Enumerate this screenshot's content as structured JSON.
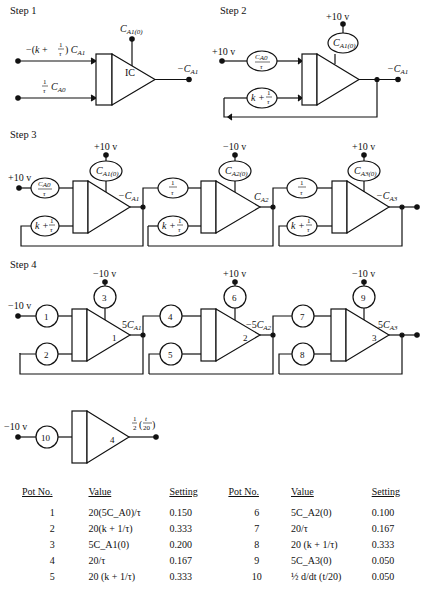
{
  "steps": [
    {
      "label": "Step 1",
      "opamp_label": "IC",
      "inputs": [
        "−(k + 1/τ) C_A1",
        "1/τ C_A0"
      ],
      "ic_input": "C_A1(0)",
      "output": "−C_A1"
    },
    {
      "label": "Step 2",
      "supply_top": "+10 v",
      "supply_in": "+10 v",
      "pots": [
        "C_A0/τ",
        "k + 1/τ",
        "C_A1(0)"
      ],
      "output": "−C_A1"
    },
    {
      "label": "Step 3",
      "stages": [
        {
          "supply_in": "+10 v",
          "supply_top": "+10 v",
          "pots": [
            "C_A0/τ",
            "k + 1/τ",
            "C_A1(0)"
          ],
          "output": "−C_A1"
        },
        {
          "supply_top": "−10 v",
          "pots": [
            "1/τ",
            "k + 1/τ",
            "C_A2(0)"
          ],
          "output": "C_A2"
        },
        {
          "supply_top": "+10 v",
          "pots": [
            "1/τ",
            "k + 1/τ",
            "C_A3(0)"
          ],
          "output": "−C_A3"
        }
      ]
    },
    {
      "label": "Step 4",
      "stages": [
        {
          "supply_in": "−10 v",
          "supply_top": "−10 v",
          "pots": [
            "1",
            "2",
            "3"
          ],
          "amp": "1",
          "output": "5C_A1"
        },
        {
          "supply_top": "+10 v",
          "pots": [
            "4",
            "5",
            "6"
          ],
          "amp": "2",
          "output": "−5C_A2"
        },
        {
          "supply_top": "−10 v",
          "pots": [
            "7",
            "8",
            "9"
          ],
          "amp": "3",
          "output": "5C_A3"
        },
        {
          "supply_in": "−10 v",
          "pots": [
            "10"
          ],
          "amp": "4",
          "output": "½ (t/20)"
        }
      ]
    }
  ],
  "table": {
    "headers": [
      "Pot No.",
      "Value",
      "Setting",
      "Pot No.",
      "Value",
      "Setting"
    ],
    "rows": [
      {
        "no1": "1",
        "val1": "20(5C_A0)/τ",
        "set1": "0.150",
        "no2": "6",
        "val2": "5C_A2(0)",
        "set2": "0.100"
      },
      {
        "no1": "2",
        "val1": "20(k + 1/τ)",
        "set1": "0.333",
        "no2": "7",
        "val2": "20/τ",
        "set2": "0.167"
      },
      {
        "no1": "3",
        "val1": "5C_A1(0)",
        "set1": "0.200",
        "no2": "8",
        "val2": "20 (k + 1/τ)",
        "set2": "0.333"
      },
      {
        "no1": "4",
        "val1": "20/τ",
        "set1": "0.167",
        "no2": "9",
        "val2": "5C_A3(0)",
        "set2": "0.050"
      },
      {
        "no1": "5",
        "val1": "20 (k + 1/τ)",
        "set1": "0.333",
        "no2": "10",
        "val2": "½ d/dt (t/20)",
        "set2": "0.050"
      }
    ]
  }
}
